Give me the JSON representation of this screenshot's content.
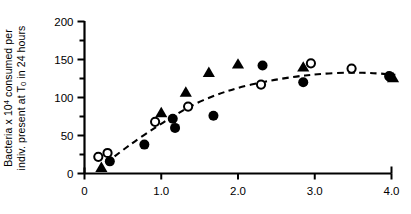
{
  "chart_data": {
    "type": "scatter",
    "title": "",
    "xlabel": "",
    "ylabel_line1_pre": "Bacteria x 10",
    "ylabel_line1_sup": "4",
    "ylabel_line1_post": " consumed per",
    "ylabel_line2_pre": "indiv. present at T",
    "ylabel_line2_sub": "0",
    "ylabel_line2_post": " in 24 hours",
    "ylabel_full": "Bacteria x 10^4 consumed per indiv. present at T_0 in 24 hours",
    "xlim": [
      0,
      4.2
    ],
    "ylim": [
      0,
      210
    ],
    "xticks": [
      0,
      1.0,
      2.0,
      3.0,
      4.0
    ],
    "xtick_labels": [
      "0",
      "1.0",
      "2.0",
      "3.0",
      "4.0"
    ],
    "yticks": [
      0,
      50,
      100,
      150,
      200
    ],
    "ytick_labels": [
      "0",
      "50",
      "100",
      "150",
      "200"
    ],
    "y_minor_ticks": [
      25,
      75,
      125,
      175
    ],
    "grid": false,
    "legend": "none",
    "axis_color": "#000000",
    "marker_color": "#000000",
    "series": [
      {
        "name": "open-circle",
        "marker": "open-circle",
        "points": [
          [
            0.18,
            22
          ],
          [
            0.3,
            27
          ],
          [
            0.92,
            68
          ],
          [
            1.35,
            88
          ],
          [
            2.3,
            117
          ],
          [
            2.95,
            145
          ],
          [
            3.48,
            138
          ],
          [
            3.97,
            128
          ]
        ]
      },
      {
        "name": "filled-circle",
        "marker": "filled-circle",
        "points": [
          [
            0.33,
            16
          ],
          [
            0.78,
            38
          ],
          [
            1.15,
            72
          ],
          [
            1.18,
            60
          ],
          [
            1.68,
            76
          ],
          [
            2.32,
            142
          ],
          [
            2.85,
            120
          ],
          [
            3.98,
            127
          ]
        ]
      },
      {
        "name": "filled-triangle",
        "marker": "filled-triangle",
        "points": [
          [
            0.22,
            8
          ],
          [
            1.0,
            80
          ],
          [
            1.32,
            107
          ],
          [
            1.62,
            133
          ],
          [
            2.0,
            144
          ],
          [
            2.85,
            140
          ],
          [
            4.02,
            126
          ]
        ]
      }
    ],
    "fit_curve": {
      "style": "dashed",
      "points": [
        [
          0.28,
          14
        ],
        [
          0.45,
          27
        ],
        [
          0.65,
          42
        ],
        [
          0.9,
          59
        ],
        [
          1.15,
          75
        ],
        [
          1.4,
          90
        ],
        [
          1.7,
          103
        ],
        [
          2.0,
          113
        ],
        [
          2.35,
          121
        ],
        [
          2.7,
          127
        ],
        [
          3.05,
          131
        ],
        [
          3.45,
          133
        ],
        [
          3.8,
          132
        ],
        [
          4.05,
          130
        ]
      ]
    }
  }
}
